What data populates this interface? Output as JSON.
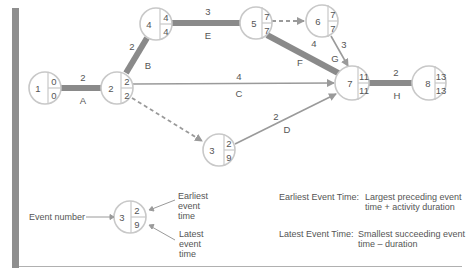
{
  "colors": {
    "critical_path": "#8a8a8a",
    "normal_arrow": "#9a9a9a",
    "node_border": "#c8c8c8",
    "text": "#555555",
    "left_bar": "#8e8e8e"
  },
  "nodes": [
    {
      "id": "1",
      "earliest": "0",
      "latest": "0"
    },
    {
      "id": "2",
      "earliest": "2",
      "latest": "2"
    },
    {
      "id": "3",
      "earliest": "2",
      "latest": "9"
    },
    {
      "id": "4",
      "earliest": "4",
      "latest": "4"
    },
    {
      "id": "5",
      "earliest": "7",
      "latest": "7"
    },
    {
      "id": "6",
      "earliest": "7",
      "latest": "7"
    },
    {
      "id": "7",
      "earliest": "11",
      "latest": "11"
    },
    {
      "id": "8",
      "earliest": "13",
      "latest": "13"
    }
  ],
  "activities": [
    {
      "name": "A",
      "from": "1",
      "to": "2",
      "duration": "2",
      "critical": true
    },
    {
      "name": "B",
      "from": "2",
      "to": "4",
      "duration": "2",
      "critical": true
    },
    {
      "name": "E",
      "from": "4",
      "to": "5",
      "duration": "3",
      "critical": true
    },
    {
      "name": "F",
      "from": "5",
      "to": "7",
      "duration": "4",
      "critical": true
    },
    {
      "name": "G",
      "from": "6",
      "to": "7",
      "duration": "3",
      "critical": false
    },
    {
      "name": "C",
      "from": "2",
      "to": "7",
      "duration": "4",
      "critical": false
    },
    {
      "name": "D",
      "from": "3",
      "to": "7",
      "duration": "2",
      "critical": false
    },
    {
      "name": "H",
      "from": "7",
      "to": "8",
      "duration": "2",
      "critical": true
    },
    {
      "name": "",
      "from": "5",
      "to": "6",
      "duration": "",
      "dummy": true
    },
    {
      "name": "",
      "from": "2",
      "to": "3",
      "duration": "",
      "dummy": true
    }
  ],
  "legend": {
    "node": {
      "id": "3",
      "earliest": "2",
      "latest": "9"
    },
    "event_number_label": "Event number",
    "earliest_label_lines": [
      "Earliest",
      "event",
      "time"
    ],
    "latest_label_lines": [
      "Latest",
      "event",
      "time"
    ]
  },
  "definitions": {
    "earliest_term": "Earliest Event Time:",
    "earliest_def_lines": [
      "Largest preceding event",
      "time + activity duration"
    ],
    "latest_term": "Latest Event Time:",
    "latest_def_lines": [
      "Smallest succeeding event",
      "time – duration"
    ]
  }
}
